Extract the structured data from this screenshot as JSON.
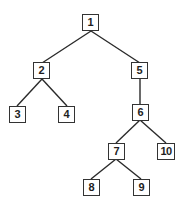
{
  "diagram": {
    "type": "tree",
    "nodes": [
      {
        "id": "1",
        "label": "1",
        "x": 91,
        "y": 23
      },
      {
        "id": "2",
        "label": "2",
        "x": 42,
        "y": 71
      },
      {
        "id": "5",
        "label": "5",
        "x": 140,
        "y": 71
      },
      {
        "id": "3",
        "label": "3",
        "x": 17,
        "y": 114
      },
      {
        "id": "4",
        "label": "4",
        "x": 67,
        "y": 114
      },
      {
        "id": "6",
        "label": "6",
        "x": 140,
        "y": 112
      },
      {
        "id": "7",
        "label": "7",
        "x": 116,
        "y": 151
      },
      {
        "id": "10",
        "label": "10",
        "x": 166,
        "y": 151
      },
      {
        "id": "8",
        "label": "8",
        "x": 91,
        "y": 187
      },
      {
        "id": "9",
        "label": "9",
        "x": 141,
        "y": 187
      }
    ],
    "edges": [
      {
        "from": "1",
        "to": "2"
      },
      {
        "from": "1",
        "to": "5"
      },
      {
        "from": "2",
        "to": "3"
      },
      {
        "from": "2",
        "to": "4"
      },
      {
        "from": "5",
        "to": "6"
      },
      {
        "from": "6",
        "to": "7"
      },
      {
        "from": "6",
        "to": "10"
      },
      {
        "from": "7",
        "to": "8"
      },
      {
        "from": "7",
        "to": "9"
      }
    ]
  }
}
